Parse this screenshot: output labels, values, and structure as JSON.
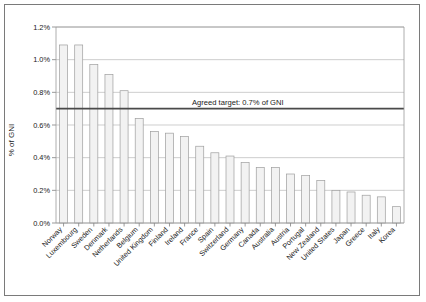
{
  "chart_data": {
    "type": "bar",
    "title": "",
    "xlabel": "",
    "ylabel": "% of GNI",
    "ylim": [
      0,
      1.2
    ],
    "ytick_labels": [
      "0.0%",
      "0.2%",
      "0.4%",
      "0.6%",
      "0.8%",
      "1.0%",
      "1.2%"
    ],
    "ytick_values": [
      0.0,
      0.2,
      0.4,
      0.6,
      0.8,
      1.0,
      1.2
    ],
    "grid": true,
    "legend": "none",
    "categories": [
      "Norway",
      "Luxembourg",
      "Sweden",
      "Denmark",
      "Netherlands",
      "Belgium",
      "United Kingdom",
      "Finland",
      "Ireland",
      "France",
      "Spain",
      "Switzerland",
      "Germany",
      "Canada",
      "Australia",
      "Austria",
      "Portugal",
      "New Zealand",
      "United States",
      "Japan",
      "Greece",
      "Italy",
      "Korea"
    ],
    "values": [
      1.09,
      1.09,
      0.97,
      0.91,
      0.81,
      0.64,
      0.56,
      0.55,
      0.53,
      0.47,
      0.43,
      0.41,
      0.37,
      0.34,
      0.34,
      0.3,
      0.29,
      0.26,
      0.2,
      0.19,
      0.17,
      0.16,
      0.1
    ],
    "annotations": [
      {
        "text": "Agreed target: 0.7% of GNI",
        "value": 0.7,
        "type": "threshold-line"
      }
    ]
  },
  "colors": {
    "bar_fill": "#f2f2f2",
    "bar_stroke": "#9e9e9e",
    "gridline": "#b9b9b9",
    "target_line": "#4a4a4a",
    "frame": "#7a7a7a"
  }
}
